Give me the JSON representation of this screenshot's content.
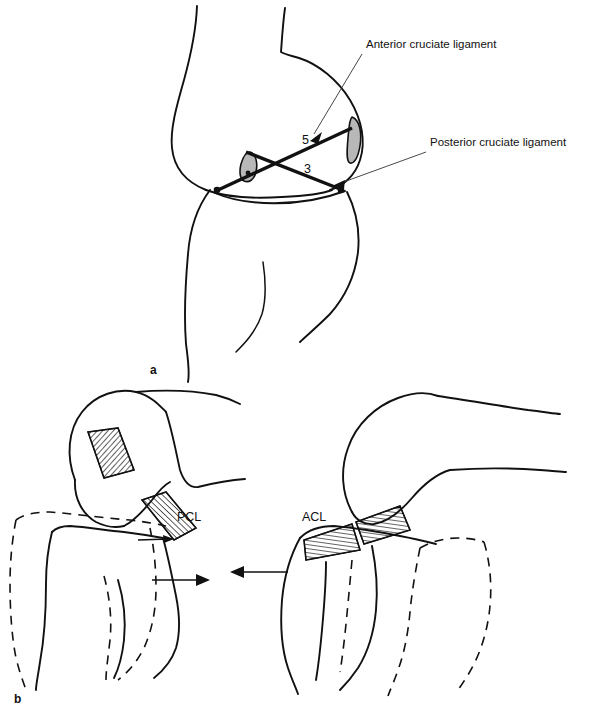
{
  "figure": {
    "background_color": "#ffffff",
    "ink_color": "#111111",
    "meniscus_fill": "#b8b8b8"
  },
  "panel_a": {
    "panel_label": "a",
    "callouts": [
      {
        "id": "acl-callout",
        "text": "Anterior cruciate ligament",
        "text_x": 366,
        "text_y": 48,
        "leader_from_x": 362,
        "leader_from_y": 54,
        "leader_to_x": 312,
        "leader_to_y": 136
      },
      {
        "id": "pcl-callout",
        "text": "Posterior cruciate ligament",
        "text_x": 430,
        "text_y": 146,
        "leader_from_x": 426,
        "leader_from_y": 152,
        "leader_to_x": 336,
        "leader_to_y": 184
      }
    ],
    "numbers": [
      {
        "id": "number-five",
        "text": "5",
        "x": 302,
        "y": 144
      },
      {
        "id": "number-three",
        "text": "3",
        "x": 304,
        "y": 173
      }
    ]
  },
  "panel_b": {
    "panel_label": "b",
    "left_knee": {
      "ligament_label": "PCL",
      "ligament_label_x": 177,
      "ligament_label_y": 521,
      "description": "Posterior drawer: tibia displaced posteriorly, dashed outline shows original position"
    },
    "right_knee": {
      "ligament_label": "ACL",
      "ligament_label_x": 302,
      "ligament_label_y": 521,
      "description": "Anterior drawer: tibia displaced anteriorly, dashed outline shows original position"
    },
    "arrows": [
      {
        "id": "arrow-right-displacement",
        "direction": "right",
        "x1": 152,
        "y1": 580,
        "x2": 208,
        "y2": 580
      },
      {
        "id": "arrow-left-displacement",
        "direction": "left",
        "x1": 288,
        "y1": 572,
        "x2": 232,
        "y2": 572
      },
      {
        "id": "arrow-small-pcl",
        "direction": "right",
        "x1": 138,
        "y1": 540,
        "x2": 172,
        "y2": 539
      }
    ]
  }
}
